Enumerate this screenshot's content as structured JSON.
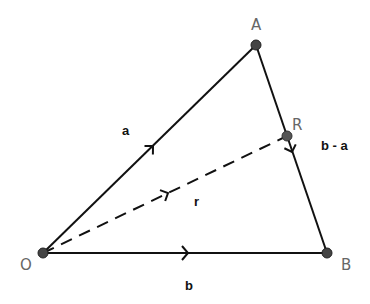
{
  "diagram": {
    "type": "vector-triangle",
    "colors": {
      "line": "#111111",
      "point": "#444444",
      "point_label": "#666666",
      "vector_label": "#111111"
    },
    "points": {
      "O": {
        "label": "O",
        "x": 43,
        "y": 253
      },
      "A": {
        "label": "A",
        "x": 256,
        "y": 45
      },
      "B": {
        "label": "B",
        "x": 327,
        "y": 253
      },
      "R": {
        "label": "R",
        "x": 287,
        "y": 136
      }
    },
    "vectors": {
      "a": {
        "label": "a",
        "from": "O",
        "to": "A",
        "style": "solid"
      },
      "b": {
        "label": "b",
        "from": "O",
        "to": "B",
        "style": "solid"
      },
      "b_minus_a": {
        "label": "b - a",
        "from": "A",
        "to": "B",
        "style": "solid"
      },
      "r": {
        "label": "r",
        "from": "O",
        "to": "R",
        "style": "dashed"
      }
    }
  }
}
